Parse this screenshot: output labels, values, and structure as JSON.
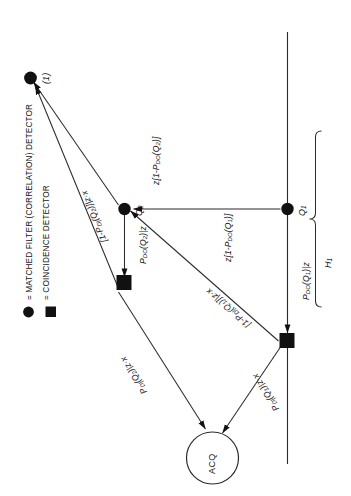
{
  "figure": {
    "orientation": "rotated-90-ccw",
    "line_color": "#2b2b2b",
    "fill_color": "#111111",
    "background": "#ffffff"
  },
  "legend": {
    "items": [
      {
        "marker": "circle",
        "glyph": "●",
        "label": "= MATCHED FILTER (CORRELATION) DETECTOR"
      },
      {
        "marker": "square",
        "glyph": "■",
        "label": "= COINCIDENCE DETECTOR"
      }
    ]
  },
  "nodes": {
    "acq": {
      "label": "ACQ",
      "shape": "circle-outline"
    },
    "sq_upper": {
      "label": "",
      "shape": "square-filled"
    },
    "sq_lower": {
      "label": "",
      "shape": "square-filled"
    },
    "q2": {
      "label": "Q2",
      "label_text": "Q",
      "label_sub": "2",
      "shape": "circle-filled"
    },
    "q1": {
      "label": "Q1",
      "label_text": "Q",
      "label_sub": "1",
      "shape": "circle-filled"
    },
    "top": {
      "label": "(1)",
      "shape": "circle-filled"
    }
  },
  "edges": [
    {
      "id": "q2-to-sq-upper",
      "label": "P_DO(Q2)|z",
      "parts": {
        "p": "P",
        "psub": "DO",
        "arg": "(Q",
        "argsub": "2",
        "tail": ")|z"
      }
    },
    {
      "id": "sq-upper-to-acq",
      "label": "P_D|(Q2)|z·x",
      "parts": {
        "p": "P",
        "psub": "D|",
        "arg": "(Q",
        "argsub": "2",
        "tail": ")|z·x"
      }
    },
    {
      "id": "sq-upper-to-top",
      "label": "[1-P_D|(Q2)]|z·x"
    },
    {
      "id": "q2-to-top",
      "label": "z[1-P_DO(Q2)]"
    },
    {
      "id": "q1-to-sq-lower",
      "label": "P_DO(Q1)|z",
      "parts": {
        "p": "P",
        "psub": "DO",
        "arg": "(Q",
        "argsub": "1",
        "tail": ")|z"
      }
    },
    {
      "id": "sq-lower-to-acq",
      "label": "P_D|(Q1)|z·x",
      "parts": {
        "p": "P",
        "psub": "D|",
        "arg": "(Q",
        "argsub": "1",
        "tail": ")|z·x"
      }
    },
    {
      "id": "sq-lower-to-q2",
      "label": "[1-P_D|(Q1)]|z·x"
    },
    {
      "id": "q1-to-q2",
      "label": "z[1-P_DO(Q1)]"
    }
  ],
  "brace": {
    "label": "H1",
    "label_text": "H",
    "label_sub": "1"
  },
  "edge_labels": {
    "pdo_q2": {
      "p": "P",
      "sub": "DO",
      "open": "(Q",
      "argsub": "2",
      "close": ")|z"
    },
    "pd_q2": {
      "p": "P",
      "sub": "D|",
      "open": "(Q",
      "argsub": "2",
      "close": ")|z·x"
    },
    "one_pd_q2": {
      "pre": "[1-",
      "p": "P",
      "sub": "D|",
      "open": "(Q",
      "argsub": "2",
      "close": ")]|z·x"
    },
    "z_one_pdo_q2": {
      "pre": "z[1-",
      "p": "P",
      "sub": "DO",
      "open": "(Q",
      "argsub": "2",
      "close": ")]"
    },
    "pdo_q1": {
      "p": "P",
      "sub": "DO",
      "open": "(Q",
      "argsub": "1",
      "close": ")|z"
    },
    "pd_q1": {
      "p": "P",
      "sub": "D|",
      "open": "(Q",
      "argsub": "1",
      "close": ")|z·x"
    },
    "one_pd_q1": {
      "pre": "[1-",
      "p": "P",
      "sub": "D|",
      "open": "(Q",
      "argsub": "1",
      "close": ")]|z·x"
    },
    "z_one_pdo_q1": {
      "pre": "z[1-",
      "p": "P",
      "sub": "DO",
      "open": "(Q",
      "argsub": "1",
      "close": ")]"
    }
  }
}
